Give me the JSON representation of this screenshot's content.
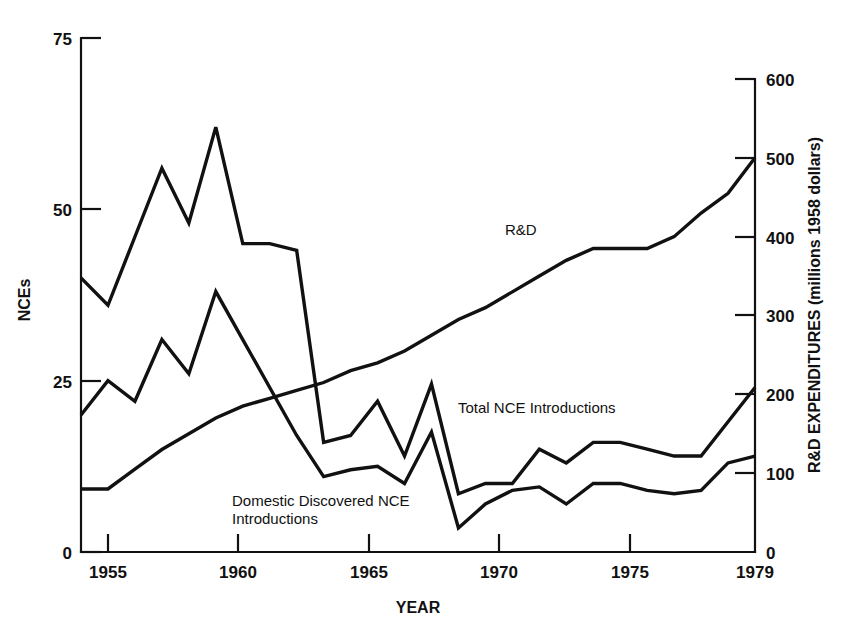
{
  "chart_data": {
    "type": "line",
    "title": "",
    "xlabel": "YEAR",
    "ylabel": "NCEs",
    "y2label": "R&D EXPENDITURES (millions 1958 dollars)",
    "xlim": [
      1954,
      1979
    ],
    "ylim": [
      0,
      75
    ],
    "y2lim": [
      0,
      600
    ],
    "grid": false,
    "legend": "inline-annotations",
    "x_ticks": [
      "1955",
      "1960",
      "1965",
      "1970",
      "1975",
      "1979"
    ],
    "x_tick_values": [
      1955,
      1960,
      1965,
      1970,
      1975,
      1979
    ],
    "y_ticks": [
      "0",
      "25",
      "50",
      "75"
    ],
    "y_tick_values": [
      0,
      25,
      50,
      75
    ],
    "y2_ticks": [
      "0",
      "100",
      "200",
      "300",
      "400",
      "500",
      "600"
    ],
    "y2_tick_values": [
      0,
      100,
      200,
      300,
      400,
      500,
      600
    ],
    "x": [
      1954,
      1955,
      1956,
      1957,
      1958,
      1959,
      1960,
      1961,
      1962,
      1963,
      1964,
      1965,
      1966,
      1967,
      1968,
      1969,
      1970,
      1971,
      1972,
      1973,
      1974,
      1975,
      1976,
      1977,
      1978,
      1979
    ],
    "series": [
      {
        "name": "Total NCE Introductions",
        "axis": "left",
        "label": "Total NCE Introductions",
        "values": [
          40,
          36,
          46,
          56,
          48,
          62,
          45,
          45,
          44,
          16,
          17,
          22,
          14,
          24.5,
          8.5,
          10,
          10,
          15,
          13,
          16,
          16,
          15,
          14,
          14,
          19,
          24
        ]
      },
      {
        "name": "Domestic Discovered NCE Introductions",
        "axis": "left",
        "label": "Domestic Discovered NCE Introductions",
        "values": [
          20,
          25,
          22,
          31,
          26,
          38,
          31,
          24,
          17,
          11,
          12,
          12.5,
          10,
          17.5,
          3.5,
          7,
          9,
          9.5,
          7,
          10,
          10,
          9,
          8.5,
          9,
          13,
          14
        ]
      },
      {
        "name": "R&D",
        "axis": "right",
        "label": "R&D",
        "values": [
          80,
          80,
          105,
          130,
          150,
          170,
          185,
          195,
          205,
          215,
          230,
          240,
          255,
          275,
          295,
          310,
          330,
          350,
          370,
          385,
          385,
          385,
          400,
          430,
          455,
          500
        ]
      }
    ],
    "annotations": [
      {
        "text": "R&D",
        "x_year": 1971.0,
        "y_value_left": 43.5
      },
      {
        "text": "Total NCE Introductions",
        "x_year": 1967.6,
        "y_value_left": 20.0
      },
      {
        "text": "Domestic Discovered NCE",
        "x_year": 1962.0,
        "y_value_left": 9.0
      },
      {
        "text": "Introductions",
        "x_year": 1962.0,
        "y_value_left": 6.6
      }
    ]
  },
  "axes": {
    "left_title": "NCEs",
    "right_title": "R&D EXPENDITURES (millions 1958 dollars)",
    "bottom_title": "YEAR"
  },
  "colors": {
    "background": "#ffffff",
    "ink": "#111111"
  }
}
